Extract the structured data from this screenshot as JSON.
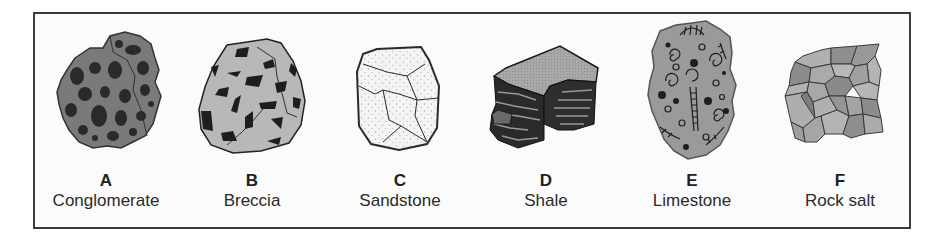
{
  "figure": {
    "frame_color": "#3a3a3a",
    "rocks": [
      {
        "letter": "A",
        "name": "Conglomerate",
        "icon": "conglomerate-rock-icon",
        "fill": "#7a7a7a",
        "clast_color": "#2a2a2a"
      },
      {
        "letter": "B",
        "name": "Breccia",
        "icon": "breccia-rock-icon",
        "fill": "#b8b8b8",
        "clast_color": "#1e1e1e"
      },
      {
        "letter": "C",
        "name": "Sandstone",
        "icon": "sandstone-rock-icon",
        "fill": "#f4f4f4",
        "clast_color": "#8a8a8a"
      },
      {
        "letter": "D",
        "name": "Shale",
        "icon": "shale-rock-icon",
        "fill": "#a8a8a8",
        "clast_color": "#262626"
      },
      {
        "letter": "E",
        "name": "Limestone",
        "icon": "limestone-fossil-rock-icon",
        "fill": "#9a9a9a",
        "clast_color": "#2a2a2a"
      },
      {
        "letter": "F",
        "name": "Rock salt",
        "icon": "rock-salt-crystal-icon",
        "fill": "#a6a6a6",
        "clast_color": "#3a3a3a"
      }
    ]
  }
}
